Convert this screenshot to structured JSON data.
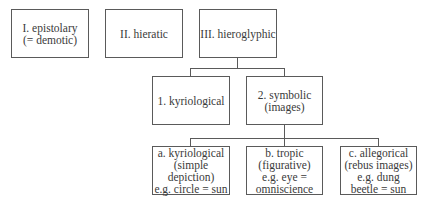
{
  "diagram": {
    "top_row": [
      {
        "id": "epistolary",
        "label": "I. epistolary\n(= demotic)"
      },
      {
        "id": "hieratic",
        "label": "II. hieratic"
      },
      {
        "id": "hieroglyphic",
        "label": "III. hieroglyphic"
      }
    ],
    "hieroglyphic_children": [
      {
        "id": "kyriological",
        "label": "1. kyriological"
      },
      {
        "id": "symbolic",
        "label": "2. symbolic\n(images)"
      }
    ],
    "symbolic_children": [
      {
        "id": "a-kyriological",
        "label": "a. kyriological\n(simple\ndepiction)\ne.g. circle = sun"
      },
      {
        "id": "b-tropic",
        "label": "b. tropic\n(figurative)\ne.g. eye =\nomniscience"
      },
      {
        "id": "c-allegorical",
        "label": "c. allegorical\n(rebus images)\ne.g. dung\nbeetle = sun"
      }
    ],
    "edges": [
      {
        "from": "hieroglyphic",
        "to": "kyriological"
      },
      {
        "from": "hieroglyphic",
        "to": "symbolic"
      },
      {
        "from": "symbolic",
        "to": "a-kyriological"
      },
      {
        "from": "symbolic",
        "to": "b-tropic"
      },
      {
        "from": "symbolic",
        "to": "c-allegorical"
      }
    ]
  }
}
